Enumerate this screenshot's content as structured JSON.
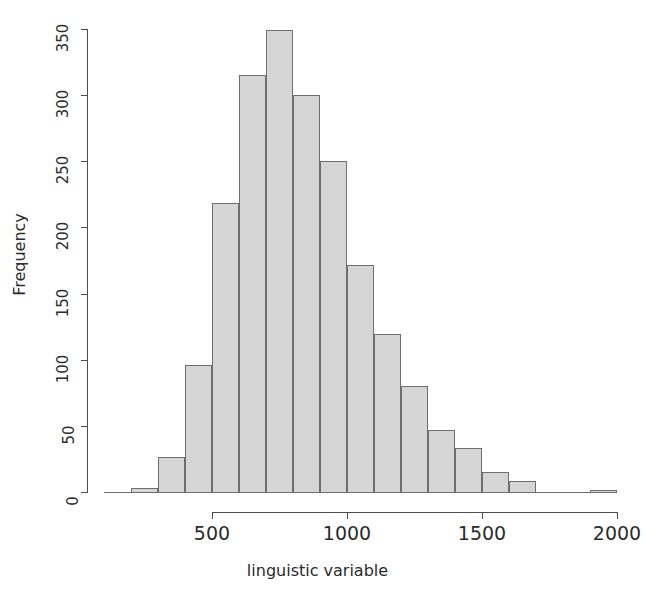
{
  "chart_data": {
    "type": "bar",
    "title": "",
    "subtitle": "",
    "xlabel": "linguistic variable",
    "ylabel": "Frequency",
    "xlim": [
      100,
      2000
    ],
    "ylim": [
      0,
      350
    ],
    "grid": false,
    "legend": null,
    "bin_width": 100,
    "bin_starts": [
      100,
      200,
      300,
      400,
      500,
      600,
      700,
      800,
      900,
      1000,
      1100,
      1200,
      1300,
      1400,
      1500,
      1600,
      1700,
      1800,
      1900
    ],
    "categories": [
      "100-200",
      "200-300",
      "300-400",
      "400-500",
      "500-600",
      "600-700",
      "700-800",
      "800-900",
      "900-1000",
      "1000-1100",
      "1100-1200",
      "1200-1300",
      "1300-1400",
      "1400-1500",
      "1500-1600",
      "1600-1700",
      "1700-1800",
      "1800-1900",
      "1900-2000"
    ],
    "values": [
      0,
      4,
      27,
      97,
      219,
      316,
      350,
      301,
      251,
      172,
      120,
      81,
      48,
      34,
      16,
      9,
      0,
      0,
      2
    ],
    "x_ticks": [
      500,
      1000,
      1500,
      2000
    ],
    "x_tick_labels": [
      "500",
      "1000",
      "1500",
      "2000"
    ],
    "y_ticks": [
      0,
      50,
      100,
      150,
      200,
      250,
      300,
      350
    ],
    "y_tick_labels": [
      "0",
      "50",
      "100",
      "150",
      "200",
      "250",
      "300",
      "350"
    ],
    "bar_fill_color": "#d6d6d6",
    "bar_border_color": "#6e6e6e",
    "axis_color": "#4d4d4d",
    "text_color": "#2b2b2b",
    "background_color": "#ffffff"
  }
}
